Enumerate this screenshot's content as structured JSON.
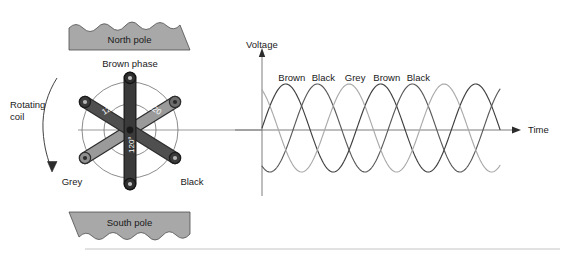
{
  "figure": {
    "title_absent": true,
    "poles": {
      "north_label": "North pole",
      "south_label": "South pole",
      "fill_color": "#a8a8a8",
      "stroke_color": "#4d4d4d"
    },
    "rotating_coil": {
      "label_line1": "Rotating",
      "label_line2": "coil",
      "arrow_direction": "clockwise-down"
    },
    "coil_diagram": {
      "phase_labels": {
        "top": "Brown phase",
        "bottom_left": "Grey",
        "bottom_right": "Black"
      },
      "angle_labels": [
        "120°",
        "120",
        "120°"
      ],
      "arm_colors": {
        "brown": "#3a3a3a",
        "black": "#4f4f4f",
        "grey": "#9a9a9a"
      },
      "circle_stroke": "#6e6e6e"
    },
    "axes": {
      "y_label": "Voltage",
      "x_label": "Time",
      "axis_color": "#6e6e6e"
    }
  },
  "chart_data": {
    "type": "line",
    "title": "",
    "xlabel": "Time",
    "ylabel": "Voltage",
    "grid": false,
    "legend_position": "above-curves-inline",
    "peak_labels": [
      "Brown",
      "Black",
      "Grey",
      "Brown",
      "Black"
    ],
    "x_range_px": [
      262,
      500
    ],
    "baseline_y_px": 128,
    "amplitude_px": 44,
    "period_px": 95,
    "series": [
      {
        "name": "Brown",
        "color": "#3f3f3f",
        "phase_deg": 0,
        "peaks_at_labels": [
          "Brown",
          "Brown"
        ]
      },
      {
        "name": "Black",
        "color": "#5a5a5a",
        "phase_deg": -120,
        "peaks_at_labels": [
          "Black",
          "Black"
        ]
      },
      {
        "name": "Grey",
        "color": "#aaaaaa",
        "phase_deg": -240,
        "peaks_at_labels": [
          "Grey"
        ]
      }
    ],
    "ylim": [
      -1,
      1
    ],
    "tick_labels_x": [],
    "tick_labels_y": []
  }
}
